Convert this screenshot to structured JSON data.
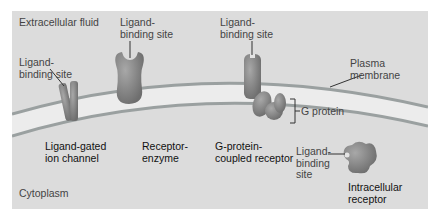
{
  "regions": {
    "extracellular": "Extracellular  fluid",
    "cytoplasm": "Cytoplasm"
  },
  "labels": {
    "plasma_membrane": "Plasma\nmembrane",
    "g_protein": "G protein",
    "ligand_binding_site": "Ligand-\nbinding site",
    "ligand_binding_site_stacked": "Ligand-\nbinding\nsite"
  },
  "receptors": [
    {
      "name": "Ligand-gated\nion channel"
    },
    {
      "name": "Receptor-\nenzyme"
    },
    {
      "name": "G-protein-\ncoupled receptor"
    },
    {
      "name": "Intracellular\nreceptor"
    }
  ],
  "colors": {
    "background": "#dcdcdc",
    "membrane_inner": "#ececec",
    "membrane_edge": "#9aa0a0",
    "protein": "#8a8a8a",
    "protein_dark": "#6a6a6a"
  }
}
